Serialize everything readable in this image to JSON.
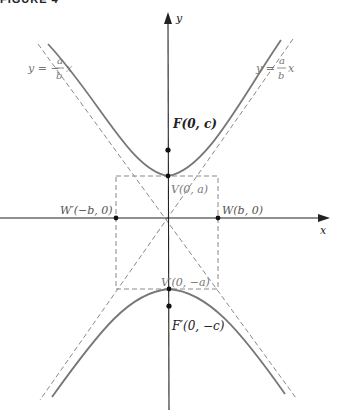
{
  "figure": {
    "heading": "FIGURE 4",
    "axes": {
      "x_label": "x",
      "y_label": "y"
    },
    "asymptotes": {
      "left": {
        "prefix": "y = −",
        "num": "a",
        "den": "b",
        "suffix": "x"
      },
      "right": {
        "prefix": "y = ",
        "num": "a",
        "den": "b",
        "suffix": "x"
      }
    },
    "points": {
      "focus_top": "F(0, c)",
      "vertex_top": "V(0, a)",
      "w_left": "W′(−b, 0)",
      "w_right": "W(b, 0)",
      "vertex_bottom": "V′(0, −a)",
      "focus_bottom": "F′(0, −c)"
    },
    "colors": {
      "axis": "#222222",
      "curve": "#777777",
      "dashed": "#8a8a8a",
      "label_gray": "#777777",
      "label_dark": "#222222"
    }
  }
}
